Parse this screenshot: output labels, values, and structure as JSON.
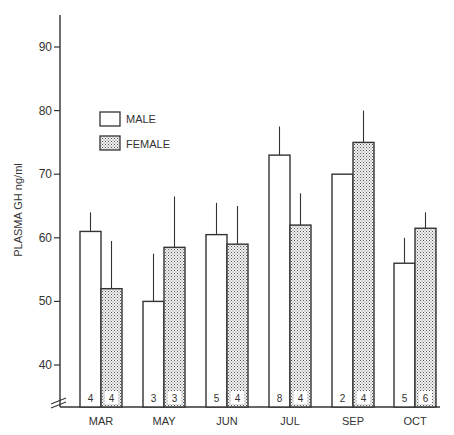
{
  "chart_data": {
    "type": "bar",
    "title": "",
    "xlabel": "",
    "ylabel": "PLASMA GH ng/ml",
    "ylim": [
      35,
      95
    ],
    "yticks": [
      40,
      50,
      60,
      70,
      80,
      90
    ],
    "axis_break": true,
    "grid": false,
    "legend_position": "upper-left inside",
    "categories": [
      "MAR",
      "MAY",
      "JUN",
      "JUL",
      "SEP",
      "OCT"
    ],
    "series": [
      {
        "name": "MALE",
        "fill": "white",
        "values": [
          61,
          50,
          60.5,
          73,
          70,
          56
        ],
        "error_upper": [
          64,
          57.5,
          65.5,
          77.5,
          70,
          60
        ],
        "n": [
          4,
          3,
          5,
          8,
          2,
          5
        ]
      },
      {
        "name": "FEMALE",
        "fill": "stippled",
        "values": [
          52,
          58.5,
          59,
          62,
          75,
          61.5
        ],
        "error_upper": [
          59.5,
          66.5,
          65,
          67,
          80,
          64
        ],
        "n": [
          4,
          3,
          4,
          4,
          4,
          6
        ]
      }
    ]
  },
  "labels": {
    "ylabel": "PLASMA GH ng/ml",
    "legend_male": "MALE",
    "legend_female": "FEMALE"
  },
  "colors": {
    "line": "#333333",
    "male_fill": "#ffffff",
    "female_fill": "#d9d9d9"
  }
}
